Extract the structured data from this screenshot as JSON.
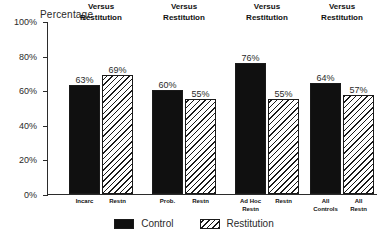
{
  "chart_data": {
    "type": "bar",
    "title": "",
    "ylabel": "Percentage",
    "xlabel": "",
    "ylim": [
      0,
      100
    ],
    "ytick_labels": [
      "0%",
      "20%",
      "40%",
      "60%",
      "80%",
      "100%"
    ],
    "ytick_values": [
      0,
      20,
      40,
      60,
      80,
      100
    ],
    "grid": false,
    "legend_position": "bottom-center",
    "series": [
      {
        "name": "Control",
        "values": [
          63,
          60,
          76,
          64
        ]
      },
      {
        "name": "Restitution",
        "values": [
          69,
          55,
          55,
          57
        ]
      }
    ],
    "groups": [
      {
        "title": "Incarceration\nVersus\nRestitution",
        "title_lines": [
          "Incarceration",
          "Versus",
          "Restitution"
        ],
        "bars": [
          {
            "series": "Control",
            "value": 63,
            "value_label": "63%",
            "tick_label": "Incarc",
            "tick_label_lines": [
              "Incarc"
            ]
          },
          {
            "series": "Restitution",
            "value": 69,
            "value_label": "69%",
            "tick_label": "Restn",
            "tick_label_lines": [
              "Restn"
            ]
          }
        ]
      },
      {
        "title": "Probation\nVersus\nRestitution",
        "title_lines": [
          "Probation",
          "Versus",
          "Restitution"
        ],
        "bars": [
          {
            "series": "Control",
            "value": 60,
            "value_label": "60%",
            "tick_label": "Prob.",
            "tick_label_lines": [
              "Prob."
            ]
          },
          {
            "series": "Restitution",
            "value": 55,
            "value_label": "55%",
            "tick_label": "Restn",
            "tick_label_lines": [
              "Restn"
            ]
          }
        ]
      },
      {
        "title": "Ad Hoc Restn.\nVersus\nRestitution",
        "title_lines": [
          "Ad Hoc Restn.",
          "Versus",
          "Restitution"
        ],
        "bars": [
          {
            "series": "Control",
            "value": 76,
            "value_label": "76%",
            "tick_label": "Ad Hoc Restn",
            "tick_label_lines": [
              "Ad Hoc",
              "Restn"
            ]
          },
          {
            "series": "Restitution",
            "value": 55,
            "value_label": "55%",
            "tick_label": "Restn",
            "tick_label_lines": [
              "Restn"
            ]
          }
        ]
      },
      {
        "title": "All Controls\nVersus\nRestitution",
        "title_lines": [
          "All Controls",
          "Versus",
          "Restitution"
        ],
        "bars": [
          {
            "series": "Control",
            "value": 64,
            "value_label": "64%",
            "tick_label": "All Controls",
            "tick_label_lines": [
              "All",
              "Controls"
            ]
          },
          {
            "series": "Restitution",
            "value": 57,
            "value_label": "57%",
            "tick_label": "All Restn",
            "tick_label_lines": [
              "All",
              "Restn"
            ]
          }
        ]
      }
    ],
    "legend": [
      {
        "label": "Control",
        "swatch": "solid-black"
      },
      {
        "label": "Restitution",
        "swatch": "diagonal-hatch"
      }
    ],
    "colors": {
      "control": "#101010",
      "restitution_hatch": "#1a1a1a",
      "axis": "#2b2b2b",
      "text": "#2a2a2a",
      "background": "#ffffff"
    }
  }
}
